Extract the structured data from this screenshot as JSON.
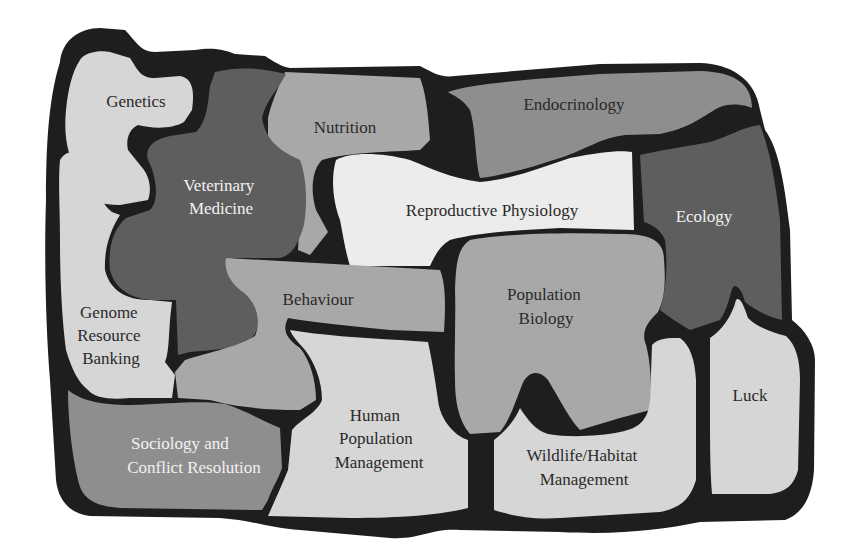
{
  "diagram": {
    "title": "",
    "colors": {
      "outline": "#1e1e1e",
      "light": "#d6d6d6",
      "lightest": "#ececec",
      "mid": "#a8a8a8",
      "mid_dark": "#8e8e8e",
      "dark": "#5e5e5e"
    },
    "pieces": [
      {
        "id": "genetics",
        "label": [
          "Genetics"
        ],
        "shade": "light",
        "text": "dark"
      },
      {
        "id": "veterinary-medicine",
        "label": [
          "Veterinary",
          "Medicine"
        ],
        "shade": "dark",
        "text": "light"
      },
      {
        "id": "nutrition",
        "label": [
          "Nutrition"
        ],
        "shade": "mid",
        "text": "dark"
      },
      {
        "id": "endocrinology",
        "label": [
          "Endocrinology"
        ],
        "shade": "mid_dark",
        "text": "dark"
      },
      {
        "id": "reproductive-physiology",
        "label": [
          "Reproductive Physiology"
        ],
        "shade": "lightest",
        "text": "dark"
      },
      {
        "id": "ecology",
        "label": [
          "Ecology"
        ],
        "shade": "dark",
        "text": "light"
      },
      {
        "id": "genome-resource-banking",
        "label": [
          "Genome",
          "Resource",
          "Banking"
        ],
        "shade": "light",
        "text": "dark"
      },
      {
        "id": "behaviour",
        "label": [
          "Behaviour"
        ],
        "shade": "mid_dark",
        "text": "dark"
      },
      {
        "id": "population-biology",
        "label": [
          "Population",
          "Biology"
        ],
        "shade": "mid",
        "text": "dark"
      },
      {
        "id": "sociology-and-conflict-resolution",
        "label": [
          "Sociology and",
          "Conflict Resolution"
        ],
        "shade": "mid_dark",
        "text": "light"
      },
      {
        "id": "human-population-management",
        "label": [
          "Human",
          "Population",
          "Management"
        ],
        "shade": "light",
        "text": "dark"
      },
      {
        "id": "wildlife-habitat-management",
        "label": [
          "Wildlife/Habitat",
          "Management"
        ],
        "shade": "light",
        "text": "dark"
      },
      {
        "id": "luck",
        "label": [
          "Luck"
        ],
        "shade": "light",
        "text": "dark"
      }
    ]
  }
}
